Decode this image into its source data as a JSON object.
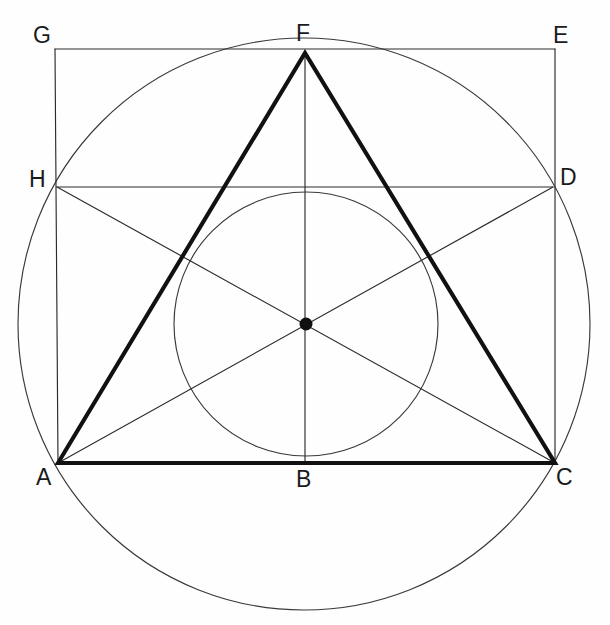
{
  "figure": {
    "background_color": "#fefefe",
    "line_color": "#2b2b2b",
    "thick_line_color": "#111111",
    "canvas": {
      "width": 610,
      "height": 625
    }
  },
  "labels": {
    "G": "G",
    "F": "F",
    "E": "E",
    "H": "H",
    "D": "D",
    "A": "A",
    "B": "B",
    "C": "C"
  },
  "label_positions": {
    "G": {
      "x": 33,
      "y": 24
    },
    "F": {
      "x": 296,
      "y": 22
    },
    "E": {
      "x": 553,
      "y": 24
    },
    "H": {
      "x": 29,
      "y": 168
    },
    "D": {
      "x": 560,
      "y": 166
    },
    "A": {
      "x": 36,
      "y": 466
    },
    "B": {
      "x": 296,
      "y": 468
    },
    "C": {
      "x": 556,
      "y": 466
    }
  },
  "geometry": {
    "points": {
      "A": {
        "x": 58,
        "y": 463
      },
      "B": {
        "x": 305,
        "y": 463
      },
      "C": {
        "x": 555,
        "y": 463
      },
      "D": {
        "x": 553,
        "y": 187
      },
      "E": {
        "x": 555,
        "y": 49
      },
      "F": {
        "x": 305,
        "y": 53
      },
      "G": {
        "x": 55,
        "y": 49
      },
      "H": {
        "x": 57,
        "y": 187
      },
      "O": {
        "x": 306,
        "y": 324
      }
    },
    "circumcircle": {
      "cx": 304,
      "cy": 324,
      "r": 286
    },
    "incircle": {
      "cx": 306,
      "cy": 324,
      "r": 132
    },
    "center_dot_radius": 6.5,
    "thick_path": "A F C A",
    "thin_segments": [
      "G-E",
      "G-A",
      "E-C",
      "A-C",
      "H-D",
      "A-D",
      "C-H",
      "F-B"
    ]
  }
}
